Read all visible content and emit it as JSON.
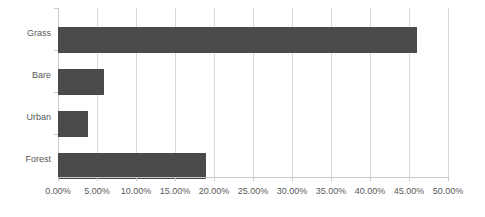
{
  "chart_data": {
    "type": "bar",
    "orientation": "horizontal",
    "title": "",
    "subtitle": "",
    "xlabel": "",
    "ylabel": "",
    "categories": [
      "Grass",
      "Bare",
      "Urban",
      "Forest"
    ],
    "values": [
      46.0,
      5.9,
      3.8,
      19.0
    ],
    "series": [
      {
        "name": "",
        "values": [
          46.0,
          5.9,
          3.8,
          19.0
        ]
      }
    ],
    "xlim": [
      0,
      50
    ],
    "xtick_labels": [
      "0.00%",
      "5.00%",
      "10.00%",
      "15.00%",
      "20.00%",
      "25.00%",
      "30.00%",
      "35.00%",
      "40.00%",
      "45.00%",
      "50.00%"
    ],
    "xtick_values": [
      0,
      5,
      10,
      15,
      20,
      25,
      30,
      35,
      40,
      45,
      50
    ],
    "grid": true,
    "grid_axis": "x",
    "legend": false,
    "legend_position": "none",
    "annotations": [],
    "colors": {
      "bar": "#4a4a4a",
      "gridline": "#d9d9d9",
      "axis": "#c8c8c8",
      "text": "#595959",
      "background": "#ffffff"
    }
  }
}
